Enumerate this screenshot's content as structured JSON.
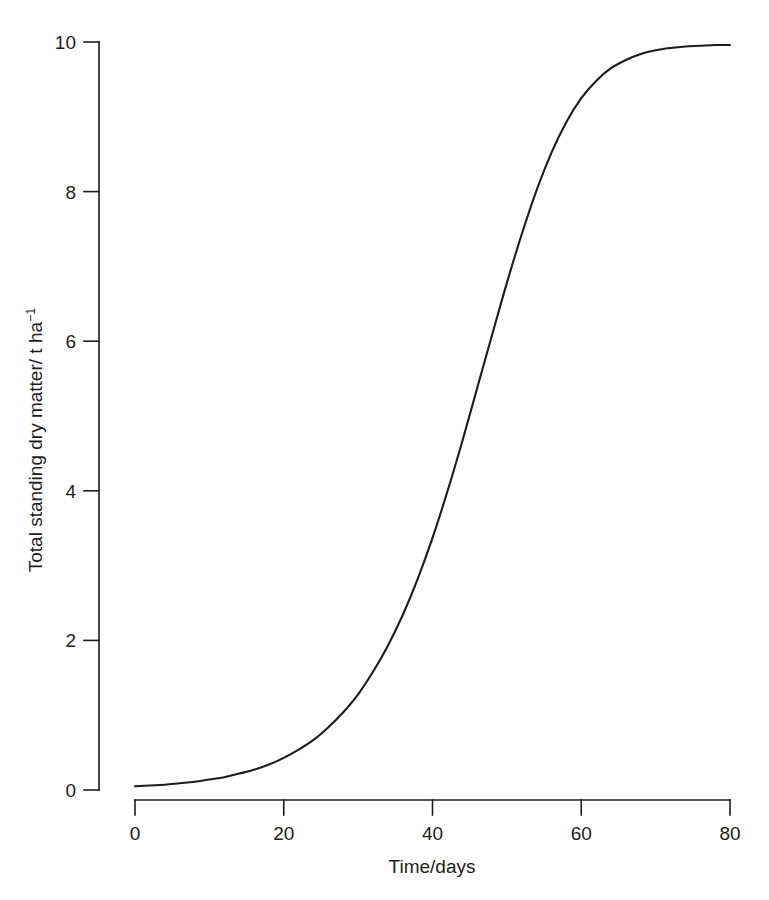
{
  "figure": {
    "background_color": "#ffffff",
    "foreground_color": "#1c1c1c"
  },
  "chart_data": {
    "type": "line",
    "title": "",
    "subtitle": "",
    "xlabel": "Time/days",
    "ylabel": "Total standing dry matter/ t ha",
    "ylabel_superscript": "−1",
    "ylabel_full": "Total standing dry matter/ t ha⁻¹",
    "xlim": [
      0,
      80
    ],
    "ylim": [
      0,
      10
    ],
    "xticks": [
      0,
      20,
      40,
      60,
      80
    ],
    "xticklabels": [
      "0",
      "20",
      "40",
      "60",
      "80"
    ],
    "yticks": [
      0,
      2,
      4,
      6,
      8,
      10
    ],
    "yticklabels": [
      "0",
      "2",
      "4",
      "6",
      "8",
      "10"
    ],
    "grid": false,
    "legend": null,
    "legend_position": "none",
    "annotations": [],
    "series": [
      {
        "name": "Total standing dry matter",
        "color": "#1c1c1c",
        "line_width": 2.1,
        "line_style": "solid",
        "markers": "none",
        "x": [
          0,
          2,
          4,
          6,
          8,
          10,
          12,
          14,
          16,
          18,
          20,
          22,
          24,
          26,
          28,
          30,
          32,
          34,
          36,
          38,
          40,
          42,
          44,
          46,
          48,
          50,
          52,
          54,
          56,
          58,
          60,
          62,
          64,
          66,
          68,
          70,
          72,
          74,
          76,
          78,
          80
        ],
        "y": [
          0.05,
          0.06,
          0.07,
          0.09,
          0.11,
          0.14,
          0.17,
          0.22,
          0.27,
          0.34,
          0.43,
          0.54,
          0.67,
          0.84,
          1.04,
          1.28,
          1.58,
          1.93,
          2.34,
          2.82,
          3.37,
          3.99,
          4.66,
          5.37,
          6.08,
          6.78,
          7.43,
          8.02,
          8.52,
          8.93,
          9.25,
          9.48,
          9.65,
          9.76,
          9.84,
          9.89,
          9.92,
          9.94,
          9.95,
          9.96,
          9.96
        ]
      }
    ]
  }
}
